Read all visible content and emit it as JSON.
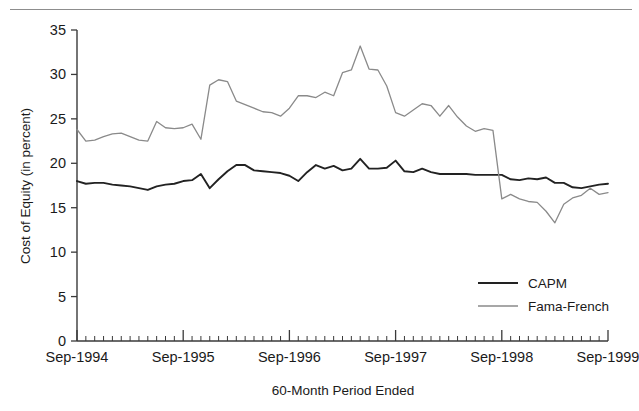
{
  "chart_data": {
    "type": "line",
    "title": "",
    "xlabel": "60-Month Period Ended",
    "ylabel": "Cost of Equity (in percent)",
    "ylim": [
      0,
      35
    ],
    "yticks": [
      0,
      5,
      10,
      15,
      20,
      25,
      30,
      35
    ],
    "xticklabels": [
      "Sep-1994",
      "Sep-1995",
      "Sep-1996",
      "Sep-1997",
      "Sep-1998",
      "Sep-1999"
    ],
    "x_major_values": [
      0,
      12,
      24,
      36,
      48,
      60
    ],
    "x_minor_interval_months": 1,
    "xlim": [
      0,
      60
    ],
    "grid": false,
    "legend_position": "inside-right-lower",
    "series": [
      {
        "name": "CAPM",
        "color": "#222222",
        "width": 1.9,
        "values": [
          18.0,
          17.7,
          17.8,
          17.8,
          17.6,
          17.5,
          17.4,
          17.2,
          17.0,
          17.4,
          17.6,
          17.7,
          18.0,
          18.1,
          18.8,
          17.2,
          18.2,
          19.1,
          19.8,
          19.8,
          19.2,
          19.1,
          19.0,
          18.9,
          18.6,
          18.0,
          19.0,
          19.8,
          19.4,
          19.7,
          19.2,
          19.4,
          20.5,
          19.4,
          19.4,
          19.5,
          20.3,
          19.1,
          19.0,
          19.4,
          19.0,
          18.8,
          18.8,
          18.8,
          18.8,
          18.7,
          18.7,
          18.7,
          18.7,
          18.2,
          18.1,
          18.3,
          18.2,
          18.4,
          17.8,
          17.8,
          17.3,
          17.2,
          17.4,
          17.6,
          17.7
        ]
      },
      {
        "name": "Fama-French",
        "color": "#8a8a8a",
        "width": 1.3,
        "values": [
          23.8,
          22.5,
          22.6,
          23.0,
          23.3,
          23.4,
          23.0,
          22.6,
          22.5,
          24.7,
          24.0,
          23.9,
          24.0,
          24.4,
          22.7,
          28.8,
          29.4,
          29.2,
          27.0,
          26.6,
          26.2,
          25.8,
          25.7,
          25.3,
          26.2,
          27.6,
          27.6,
          27.4,
          28.0,
          27.6,
          30.2,
          30.5,
          33.2,
          30.6,
          30.5,
          28.7,
          25.7,
          25.3,
          26.0,
          26.7,
          26.5,
          25.3,
          26.5,
          25.2,
          24.2,
          23.6,
          23.9,
          23.7,
          16.0,
          16.5,
          16.0,
          15.7,
          15.6,
          14.6,
          13.3,
          15.4,
          16.1,
          16.4,
          17.2,
          16.5,
          16.7
        ]
      }
    ]
  },
  "legend": {
    "items": [
      {
        "label": "CAPM",
        "color": "#222222"
      },
      {
        "label": "Fama-French",
        "color": "#8a8a8a"
      }
    ]
  }
}
